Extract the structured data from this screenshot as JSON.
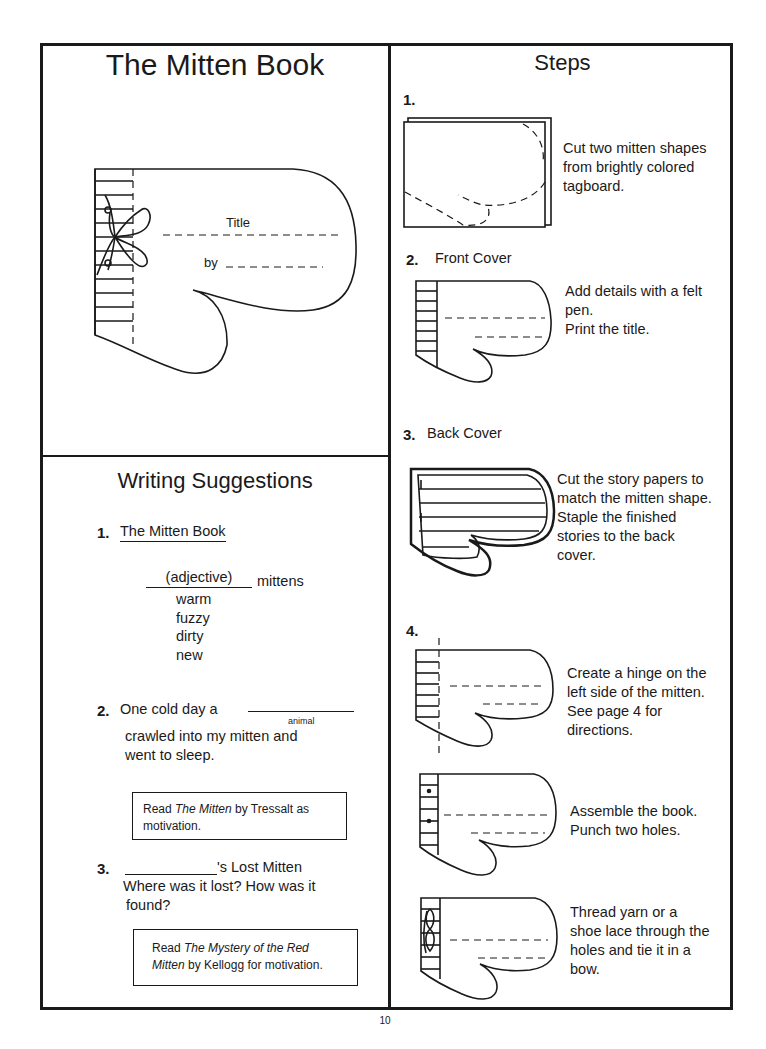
{
  "page": {
    "number": "10"
  },
  "cover_panel": {
    "title": "The Mitten Book",
    "illustration": {
      "icon": "mitten-cover-with-bow-icon",
      "title_label": "Title",
      "by_label": "by"
    }
  },
  "steps_panel": {
    "title": "Steps",
    "steps": [
      {
        "number": "1.",
        "heading": "",
        "icon": "tagboard-mitten-outline-icon",
        "text": [
          "Cut two mitten shapes",
          "from brightly colored",
          "tagboard."
        ]
      },
      {
        "number": "2.",
        "heading": "Front Cover",
        "icon": "mitten-front-cover-icon",
        "text": [
          "Add details with a felt",
          "pen.",
          "Print the title."
        ]
      },
      {
        "number": "3.",
        "heading": "Back Cover",
        "icon": "mitten-back-cover-lined-icon",
        "text": [
          "Cut the story papers to",
          "match the mitten shape.",
          "Staple the finished",
          "stories to the back",
          "cover."
        ]
      },
      {
        "number": "4.",
        "heading": "",
        "substeps": [
          {
            "icon": "mitten-hinge-icon",
            "text": [
              "Create a hinge on the",
              "left side of the mitten.",
              "See page  4  for",
              "directions."
            ]
          },
          {
            "icon": "mitten-punched-holes-icon",
            "text": [
              "Assemble the book.",
              "Punch two holes."
            ]
          },
          {
            "icon": "mitten-tied-bow-icon",
            "text": [
              "Thread  yarn or a",
              "shoe lace through the",
              "holes and tie it in a",
              "bow."
            ]
          }
        ]
      }
    ]
  },
  "writing_panel": {
    "title": "Writing Suggestions",
    "items": [
      {
        "number": "1.",
        "heading": "The Mitten Book",
        "blank_label": "(adjective)",
        "suffix": "mittens",
        "examples": [
          "warm",
          "fuzzy",
          "dirty",
          "new"
        ]
      },
      {
        "number": "2.",
        "line1_prefix": "One cold day a",
        "blank_caption": "animal",
        "line2": "crawled into my mitten and",
        "line3": "went to sleep.",
        "note": {
          "pre": "Read ",
          "book": "The Mitten",
          "post": " by Tressalt as",
          "line2": "motivation."
        }
      },
      {
        "number": "3.",
        "suffix": "'s Lost Mitten",
        "line2": "Where was it lost? How was it",
        "line3": "found?",
        "note": {
          "pre": "Read ",
          "book_part1": "The Mystery of the Red",
          "book_part2": "Mitten",
          "post": " by Kellogg for motivation."
        }
      }
    ]
  }
}
